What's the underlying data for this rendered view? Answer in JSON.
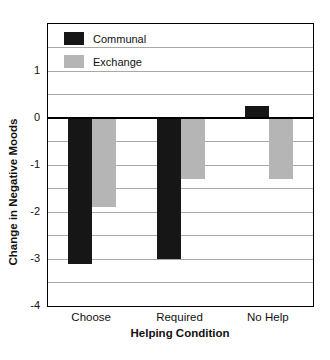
{
  "chart_data": {
    "type": "bar",
    "title": "",
    "xlabel": "Helping Condition",
    "ylabel": "Change in Negative Moods",
    "categories": [
      "Choose",
      "Required",
      "No Help"
    ],
    "series": [
      {
        "name": "Communal",
        "color": "#161616",
        "values": [
          -3.1,
          -3.0,
          0.25
        ]
      },
      {
        "name": "Exchange",
        "color": "#b5b5b5",
        "values": [
          -1.9,
          -1.3,
          -1.3
        ]
      }
    ],
    "ylim": [
      -4,
      2
    ],
    "yticks": [
      1,
      0,
      -1,
      -2,
      -3,
      -4
    ],
    "gridline_step": 0.5,
    "grid": "on",
    "zero_line": true,
    "legend_position": "top-left-inside"
  },
  "colors": {
    "bar_communal": "#161616",
    "bar_exchange": "#b5b5b5",
    "gridline": "#a9a9a9",
    "axis": "#000000",
    "text": "#111111",
    "background": "#ffffff"
  }
}
